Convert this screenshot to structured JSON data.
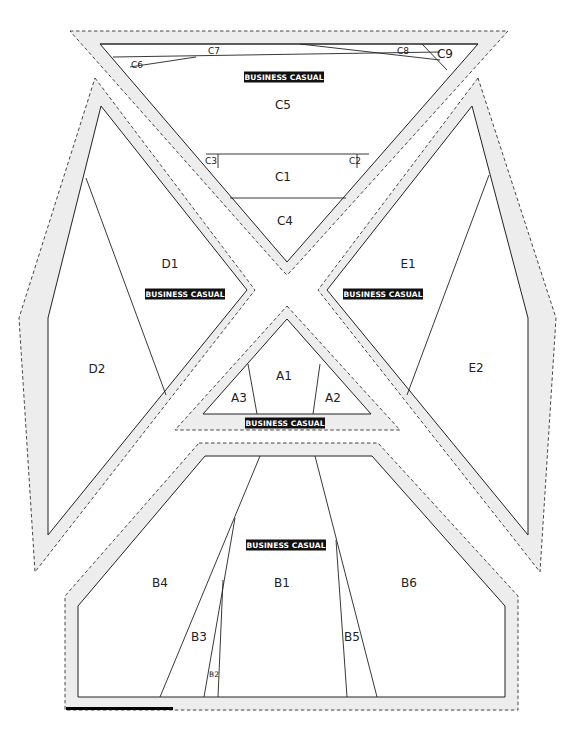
{
  "tag_text": "BUSINESS CASUAL",
  "pieces": {
    "C": {
      "allowance": "70,31 508,31 292,270 287,275 282,270",
      "outline": "100,44 478,44 287,262",
      "seams": [
        [
          100,
          44,
          478,
          44
        ],
        [
          113,
          57,
          440,
          52
        ],
        [
          130,
          67,
          196,
          57
        ],
        [
          300,
          44,
          440,
          60
        ],
        [
          422,
          44,
          447,
          70
        ],
        [
          206,
          154,
          369,
          154
        ],
        [
          218,
          154,
          218,
          168
        ],
        [
          357,
          154,
          357,
          168
        ],
        [
          230,
          198,
          346,
          198
        ]
      ],
      "labels": [
        {
          "id": "C1",
          "text": "C1",
          "x": 283,
          "y": 177,
          "size": "md"
        },
        {
          "id": "C2",
          "text": "C2",
          "x": 355,
          "y": 161,
          "size": "sm"
        },
        {
          "id": "C3",
          "text": "C3",
          "x": 211,
          "y": 161,
          "size": "sm"
        },
        {
          "id": "C4",
          "text": "C4",
          "x": 285,
          "y": 221,
          "size": "md"
        },
        {
          "id": "C5",
          "text": "C5",
          "x": 283,
          "y": 105,
          "size": "md"
        },
        {
          "id": "C6",
          "text": "C6",
          "x": 137,
          "y": 65,
          "size": "sm"
        },
        {
          "id": "C7",
          "text": "C7",
          "x": 214,
          "y": 51,
          "size": "sm"
        },
        {
          "id": "C8",
          "text": "C8",
          "x": 403,
          "y": 51,
          "size": "sm"
        },
        {
          "id": "C9",
          "text": "C9",
          "x": 445,
          "y": 54,
          "size": "md"
        }
      ],
      "tag": {
        "x": 284,
        "y": 77
      }
    },
    "D": {
      "allowance": "95,78 255,290 35,572 19,318",
      "outline": "101,106 247,290 48,535 48,318",
      "seams": [
        [
          86,
          178,
          166,
          395
        ]
      ],
      "labels": [
        {
          "id": "D1",
          "text": "D1",
          "x": 170,
          "y": 264,
          "size": "md"
        },
        {
          "id": "D2",
          "text": "D2",
          "x": 97,
          "y": 369,
          "size": "md"
        }
      ],
      "tag": {
        "x": 185,
        "y": 294
      }
    },
    "E": {
      "allowance": "478,78 318,290 540,572 556,318",
      "outline": "472,106 327,290 528,535 528,318",
      "seams": [
        [
          489,
          175,
          407,
          395
        ]
      ],
      "labels": [
        {
          "id": "E1",
          "text": "E1",
          "x": 408,
          "y": 264,
          "size": "md"
        },
        {
          "id": "E2",
          "text": "E2",
          "x": 476,
          "y": 368,
          "size": "md"
        }
      ],
      "tag": {
        "x": 383,
        "y": 294
      }
    },
    "A": {
      "allowance": "287,306 400,430 175,430",
      "outline": "287,319 371,414 203,414",
      "seams": [
        [
          248,
          364,
          257,
          414
        ],
        [
          320,
          364,
          313,
          414
        ]
      ],
      "labels": [
        {
          "id": "A1",
          "text": "A1",
          "x": 284,
          "y": 376,
          "size": "md"
        },
        {
          "id": "A2",
          "text": "A2",
          "x": 333,
          "y": 398,
          "size": "md"
        },
        {
          "id": "A3",
          "text": "A3",
          "x": 239,
          "y": 398,
          "size": "md"
        }
      ],
      "tag": {
        "x": 285,
        "y": 423
      }
    },
    "B": {
      "allowance": "199,443 378,443 518,596 518,710 65,710 65,596",
      "outline": "205,456 372,456 505,606 505,697 78,697 78,606",
      "seams": [
        [
          260,
          456,
          160,
          697
        ],
        [
          235,
          518,
          204,
          697
        ],
        [
          223,
          580,
          218,
          697
        ],
        [
          315,
          456,
          377,
          697
        ],
        [
          336,
          540,
          347,
          697
        ]
      ],
      "labels": [
        {
          "id": "B1",
          "text": "B1",
          "x": 282,
          "y": 583,
          "size": "md"
        },
        {
          "id": "B2",
          "text": "B2",
          "x": 214,
          "y": 675,
          "size": "xs"
        },
        {
          "id": "B3",
          "text": "B3",
          "x": 199,
          "y": 637,
          "size": "md"
        },
        {
          "id": "B4",
          "text": "B4",
          "x": 160,
          "y": 583,
          "size": "md"
        },
        {
          "id": "B5",
          "text": "B5",
          "x": 352,
          "y": 637,
          "size": "md"
        },
        {
          "id": "B6",
          "text": "B6",
          "x": 409,
          "y": 583,
          "size": "md"
        }
      ],
      "tag": {
        "x": 286,
        "y": 545
      }
    }
  },
  "scale_bar": {
    "x": 66,
    "y": 707,
    "width": 107,
    "height": 3
  }
}
